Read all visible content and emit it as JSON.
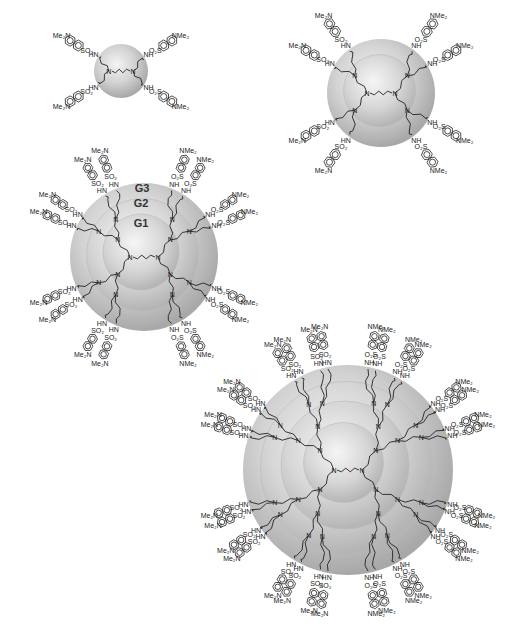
{
  "figure": {
    "colors": {
      "sphere_highlight": "#f2f2f2",
      "sphere_mid": "#cfcfcf",
      "sphere_edge": "#a9a9a9",
      "ink": "#222222"
    }
  },
  "dendrimers": [
    {
      "id": "G1",
      "center": [
        121,
        71
      ],
      "shells": [
        27
      ],
      "peripheral_groups": 4,
      "core_atoms": [
        {
          "label": "N",
          "x": 110,
          "y": 72
        },
        {
          "label": "N",
          "x": 138,
          "y": 72
        }
      ],
      "dansyl_labels": [
        {
          "amine": "Me₂N",
          "x": 55,
          "y": 30,
          "so2": "SO₂",
          "sx": 98,
          "sy": 44,
          "nh": "HN",
          "nx": 90,
          "ny": 54
        },
        {
          "amine": "NMe₂",
          "x": 175,
          "y": 28,
          "so2": "O₂S",
          "sx": 148,
          "sy": 48,
          "nh": "NH",
          "nx": 160,
          "ny": 58
        },
        {
          "amine": "Me₂N",
          "x": 65,
          "y": 128,
          "so2": "SO₂",
          "sx": 103,
          "sy": 108,
          "nh": "HN",
          "nx": 88,
          "ny": 96
        },
        {
          "amine": "NMe₂",
          "x": 185,
          "y": 128,
          "so2": "O₂S",
          "sx": 151,
          "sy": 110,
          "nh": "NH",
          "nx": 160,
          "ny": 98
        }
      ]
    },
    {
      "id": "G2",
      "center": [
        381,
        93
      ],
      "shells": [
        54,
        36
      ],
      "peripheral_groups": 8,
      "dansyl_labels": [
        {
          "amine": "Me₂N",
          "x": 322,
          "y": 24
        },
        {
          "amine": "NMe₂",
          "x": 416,
          "y": 24
        },
        {
          "amine": "NMe₂",
          "x": 465,
          "y": 62
        },
        {
          "amine": "NMe₂",
          "x": 460,
          "y": 130
        },
        {
          "amine": "NMe₂",
          "x": 418,
          "y": 172
        },
        {
          "amine": "Me₂N",
          "x": 330,
          "y": 172
        },
        {
          "amine": "Me₂N",
          "x": 290,
          "y": 130
        },
        {
          "amine": "Me₂N",
          "x": 290,
          "y": 62
        }
      ]
    },
    {
      "id": "G3",
      "center": [
        144,
        257
      ],
      "shells": [
        74,
        56,
        38
      ],
      "peripheral_groups": 16,
      "generation_labels": [
        {
          "text": "G3",
          "x": 142,
          "y": 192
        },
        {
          "text": "G2",
          "x": 141,
          "y": 207
        },
        {
          "text": "G1",
          "x": 141,
          "y": 227
        }
      ]
    },
    {
      "id": "G4",
      "center": [
        348,
        470
      ],
      "shells": [
        105,
        86,
        64,
        40
      ],
      "peripheral_groups": 32
    }
  ],
  "atom_labels": {
    "nitrogen": "N",
    "amine_left": "Me₂N",
    "amine_right": "NMe₂",
    "sulfonyl": "SO₂",
    "sulfonyl_rev": "O₂S",
    "nh": "NH",
    "hn": "HN",
    "h": "H"
  }
}
